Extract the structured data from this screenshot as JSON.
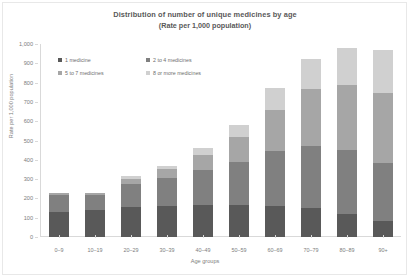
{
  "chart_data": {
    "type": "bar",
    "subtype": "stacked-bar",
    "title": "Distribution of number of unique medicines by age",
    "subtitle": "(Rate per 1,000 population)",
    "xlabel": "Age groups",
    "ylabel": "Rate per 1,000 population",
    "ylim": [
      0,
      1000
    ],
    "ytick_step": 100,
    "yticks": [
      "0",
      "100",
      "200",
      "300",
      "400",
      "500",
      "600",
      "700",
      "800",
      "900",
      "1,000"
    ],
    "grid": false,
    "legend_position": "top-left-inside",
    "categories": [
      "0–9",
      "10–19",
      "20–29",
      "30–39",
      "40–49",
      "50–59",
      "60–69",
      "70–79",
      "80–89",
      "90+"
    ],
    "series": [
      {
        "name": "1 medicine",
        "color": "#595959",
        "values": [
          128,
          140,
          155,
          160,
          165,
          168,
          160,
          150,
          120,
          85
        ]
      },
      {
        "name": "2 to 4 medicines",
        "color": "#808080",
        "values": [
          88,
          78,
          120,
          145,
          180,
          222,
          285,
          320,
          330,
          300
        ]
      },
      {
        "name": "5 to 7 medicines",
        "color": "#a6a6a6",
        "values": [
          10,
          9,
          28,
          45,
          80,
          130,
          215,
          295,
          340,
          360
        ]
      },
      {
        "name": "8 or more medicines",
        "color": "#d0d0d0",
        "values": [
          4,
          3,
          12,
          20,
          35,
          60,
          110,
          160,
          190,
          225
        ]
      }
    ],
    "totals": [
      230,
      230,
      315,
      370,
      460,
      580,
      770,
      925,
      980,
      970
    ]
  },
  "legend": {
    "items": [
      {
        "label": "1 medicine",
        "color": "#595959"
      },
      {
        "label": "2 to 4 medicines",
        "color": "#808080"
      },
      {
        "label": "5 to 7 medicines",
        "color": "#a6a6a6"
      },
      {
        "label": "8 or more medicines",
        "color": "#d0d0d0"
      }
    ]
  }
}
